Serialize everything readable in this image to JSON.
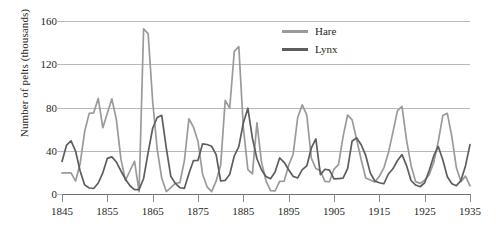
{
  "chart_data": {
    "type": "line",
    "title": "",
    "xlabel": "",
    "ylabel": "Number of pelts (thousands)",
    "xlim": [
      1845,
      1935
    ],
    "ylim": [
      0,
      160
    ],
    "xticks": [
      1845,
      1855,
      1865,
      1875,
      1885,
      1895,
      1905,
      1915,
      1925,
      1935
    ],
    "yticks": [
      0,
      40,
      80,
      120,
      160
    ],
    "grid": "horizontal",
    "legend_position": "top-right",
    "colors": {
      "hare": "#9a9a9a",
      "lynx": "#5d5d5d",
      "gridline": "#b9b9b9",
      "axis": "#6d6d6d",
      "text": "#231f20"
    },
    "x": [
      1845,
      1846,
      1847,
      1848,
      1849,
      1850,
      1851,
      1852,
      1853,
      1854,
      1855,
      1856,
      1857,
      1858,
      1859,
      1860,
      1861,
      1862,
      1863,
      1864,
      1865,
      1866,
      1867,
      1868,
      1869,
      1870,
      1871,
      1872,
      1873,
      1874,
      1875,
      1876,
      1877,
      1878,
      1879,
      1880,
      1881,
      1882,
      1883,
      1884,
      1885,
      1886,
      1887,
      1888,
      1889,
      1890,
      1891,
      1892,
      1893,
      1894,
      1895,
      1896,
      1897,
      1898,
      1899,
      1900,
      1901,
      1902,
      1903,
      1904,
      1905,
      1906,
      1907,
      1908,
      1909,
      1910,
      1911,
      1912,
      1913,
      1914,
      1915,
      1916,
      1917,
      1918,
      1919,
      1920,
      1921,
      1922,
      1923,
      1924,
      1925,
      1926,
      1927,
      1928,
      1929,
      1930,
      1931,
      1932,
      1933,
      1934,
      1935
    ],
    "series": [
      {
        "name": "Hare",
        "color": "#9a9a9a",
        "values": [
          19.58,
          19.6,
          19.61,
          11.99,
          28.04,
          58.0,
          74.6,
          75.09,
          88.48,
          61.28,
          74.67,
          88.06,
          68.51,
          32.19,
          12.64,
          21.49,
          30.35,
          2.18,
          152.65,
          148.36,
          85.81,
          41.41,
          14.75,
          2.28,
          5.91,
          9.95,
          10.44,
          30.93,
          69.58,
          61.91,
          48.57,
          18.56,
          6.62,
          2.18,
          11.84,
          26.76,
          86.63,
          79.47,
          131.88,
          136.35,
          61.61,
          22.53,
          18.68,
          65.84,
          29.71,
          12.21,
          3.17,
          2.78,
          11.66,
          11.83,
          26.56,
          37.02,
          71.01,
          82.41,
          73.03,
          33.25,
          23.61,
          21.46,
          11.75,
          11.34,
          23.1,
          27.16,
          53.13,
          73.08,
          68.51,
          50.35,
          31.62,
          14.81,
          12.99,
          11.06,
          16.41,
          24.24,
          38.04,
          57.19,
          77.18,
          80.96,
          49.91,
          26.42,
          11.46,
          9.8,
          12.7,
          17.83,
          29.07,
          48.57,
          72.51,
          74.64,
          52.94,
          24.2,
          11.49,
          16.5,
          7.48
        ],
        "max": 152.65,
        "min": 2.18
      },
      {
        "name": "Lynx",
        "color": "#5d5d5d",
        "values": [
          30.09,
          45.15,
          49.15,
          39.52,
          21.23,
          8.42,
          5.56,
          5.08,
          10.17,
          19.6,
          32.91,
          34.38,
          29.59,
          21.3,
          13.69,
          7.65,
          4.08,
          4.09,
          14.33,
          38.22,
          60.78,
          70.77,
          72.77,
          42.68,
          16.39,
          9.83,
          5.8,
          5.26,
          18.91,
          30.95,
          31.18,
          46.34,
          45.77,
          44.15,
          36.33,
          12.03,
          12.6,
          18.34,
          35.14,
          43.77,
          65.69,
          79.35,
          51.65,
          32.59,
          22.45,
          16.16,
          14.12,
          20.38,
          33.33,
          29.35,
          22.4,
          16.27,
          14.83,
          22.59,
          25.95,
          42.58,
          50.96,
          17.81,
          22.89,
          22.08,
          13.92,
          14.26,
          14.6,
          23.37,
          49.05,
          51.82,
          45.53,
          35.66,
          19.56,
          12.0,
          10.37,
          9.47,
          18.5,
          23.3,
          31.0,
          36.4,
          26.3,
          12.5,
          8.3,
          6.7,
          10.4,
          21.7,
          35.2,
          44.0,
          31.7,
          16.0,
          9.5,
          7.7,
          12.4,
          26.0,
          45.7
        ],
        "max": 79.35,
        "min": 4.08
      }
    ],
    "legend": [
      {
        "label": "Hare",
        "color": "#9a9a9a"
      },
      {
        "label": "Lynx",
        "color": "#5d5d5d"
      }
    ]
  },
  "axes": {
    "y_title": "Number of pelts (thousands)",
    "y_tick_labels": [
      "0",
      "40",
      "80",
      "120",
      "160"
    ],
    "x_tick_labels": [
      "1845",
      "1855",
      "1865",
      "1875",
      "1885",
      "1895",
      "1905",
      "1915",
      "1925",
      "1935"
    ]
  },
  "legend": {
    "hare_label": "Hare",
    "lynx_label": "Lynx"
  }
}
